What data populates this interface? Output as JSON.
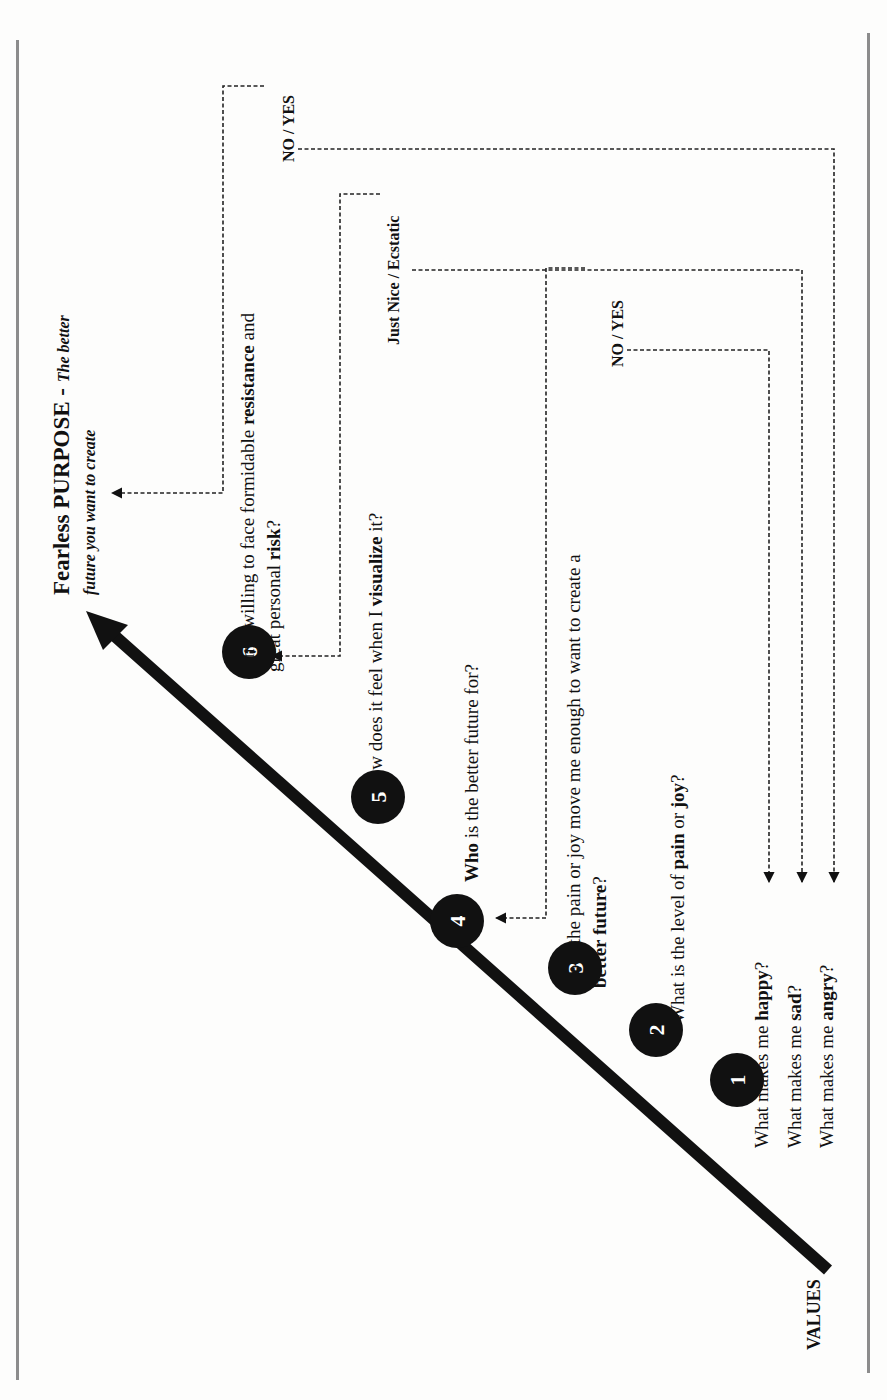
{
  "purpose": {
    "title": "Fearless PURPOSE",
    "dash": " - ",
    "subtitle_line1": "The better",
    "subtitle_line2": "future you want to create"
  },
  "start_label": "VALUES",
  "steps": [
    {
      "number": "1",
      "questions": [
        {
          "pre": "What makes me ",
          "bold": "happy",
          "post": "?"
        },
        {
          "pre": "What makes me ",
          "bold": "sad",
          "post": "?"
        },
        {
          "pre": "What makes me ",
          "bold": "angry",
          "post": "?"
        }
      ]
    },
    {
      "number": "2",
      "question": {
        "pre": "What is the level of ",
        "bold1": "pain",
        "mid": " or ",
        "bold2": "joy",
        "post": "?"
      }
    },
    {
      "number": "3",
      "question": {
        "line1": "Does the pain or joy move me enough to want to create a",
        "line2_bold": "better future",
        "line2_post": "?"
      }
    },
    {
      "number": "4",
      "question": {
        "bold": "Who",
        "post": " is the better future for?"
      }
    },
    {
      "number": "5",
      "question": {
        "pre": "How does it feel when I ",
        "bold": "visualize",
        "post": " it?"
      }
    },
    {
      "number": "6",
      "question": {
        "line1_pre": "Am I willing to face formidable ",
        "line1_bold": "resistance",
        "line1_post": " and",
        "line2_pre": "great personal ",
        "line2_bold": "risk",
        "line2_post": "?"
      }
    }
  ],
  "answers": {
    "step3": "NO / YES",
    "step5": "Just Nice / Ecstatic",
    "step6": "NO / YES"
  },
  "colors": {
    "ink": "#111111",
    "frame": "#8c8c8c",
    "background": "#fdfdfc"
  }
}
